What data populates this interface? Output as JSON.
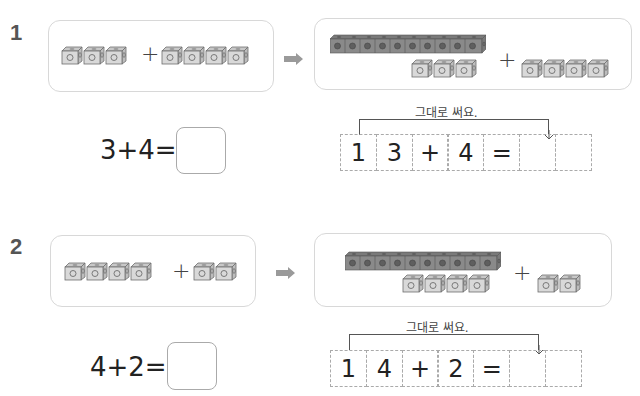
{
  "problems": [
    {
      "number": "1",
      "left_panel": {
        "group_a_count": 3,
        "group_b_count": 4,
        "operator": "+"
      },
      "right_panel": {
        "ten_rod_count": 10,
        "remaining_cubes": 3,
        "added_cubes": 4,
        "operator": "+"
      },
      "equation": {
        "text": "3+4=",
        "answer": ""
      },
      "hint_label": "그대로 써요.",
      "cells": [
        "1",
        "3",
        "+",
        "4",
        "=",
        "",
        ""
      ]
    },
    {
      "number": "2",
      "left_panel": {
        "group_a_count": 4,
        "group_b_count": 2,
        "operator": "+"
      },
      "right_panel": {
        "ten_rod_count": 10,
        "remaining_cubes": 4,
        "added_cubes": 2,
        "operator": "+"
      },
      "equation": {
        "text": "4+2=",
        "answer": ""
      },
      "hint_label": "그대로 써요.",
      "cells": [
        "1",
        "4",
        "+",
        "2",
        "=",
        "",
        ""
      ]
    }
  ],
  "icons": {
    "arrow": "right-arrow-icon",
    "cube": "connecting-cube-icon",
    "rod": "ten-cube-rod-icon"
  },
  "colors": {
    "cube_face": "#d9d9d9",
    "cube_edge": "#6e6e6e",
    "rod": "#8a8a8a",
    "arrow": "#9a9a9a",
    "panel_border": "#d8d8d8"
  }
}
